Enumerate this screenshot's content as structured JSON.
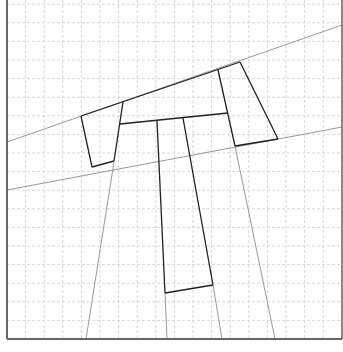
{
  "diagram": {
    "width": 343,
    "height": 352,
    "frame": {
      "left": 7,
      "right": 342,
      "top": 0,
      "bottom": 339,
      "color": "#666666"
    },
    "grid": {
      "spacing": 18.6,
      "color": "#d8d8d8",
      "dash": "3,2"
    },
    "thin_lines": [
      {
        "x1": 7,
        "y1": 142,
        "x2": 342,
        "y2": 25
      },
      {
        "x1": 7,
        "y1": 190,
        "x2": 342,
        "y2": 127
      },
      {
        "x1": 114,
        "y1": 162,
        "x2": 86,
        "y2": 339
      },
      {
        "x1": 165,
        "y1": 293,
        "x2": 167,
        "y2": 339
      },
      {
        "x1": 213,
        "y1": 285,
        "x2": 222,
        "y2": 339
      },
      {
        "x1": 235,
        "y1": 146,
        "x2": 275,
        "y2": 339
      }
    ],
    "thick_lines": [
      {
        "x1": 81,
        "y1": 116,
        "x2": 240,
        "y2": 62
      },
      {
        "x1": 81,
        "y1": 116,
        "x2": 92,
        "y2": 167
      },
      {
        "x1": 92,
        "y1": 167,
        "x2": 114,
        "y2": 161
      },
      {
        "x1": 123,
        "y1": 102,
        "x2": 114,
        "y2": 161
      },
      {
        "x1": 120,
        "y1": 124,
        "x2": 228,
        "y2": 113
      },
      {
        "x1": 218,
        "y1": 70,
        "x2": 235,
        "y2": 146
      },
      {
        "x1": 240,
        "y1": 62,
        "x2": 278,
        "y2": 139
      },
      {
        "x1": 235,
        "y1": 146,
        "x2": 278,
        "y2": 139
      },
      {
        "x1": 157,
        "y1": 121,
        "x2": 165,
        "y2": 293
      },
      {
        "x1": 183,
        "y1": 118,
        "x2": 213,
        "y2": 285
      },
      {
        "x1": 165,
        "y1": 293,
        "x2": 213,
        "y2": 285
      }
    ],
    "thin_color": "#999999",
    "thick_color": "#222222"
  }
}
